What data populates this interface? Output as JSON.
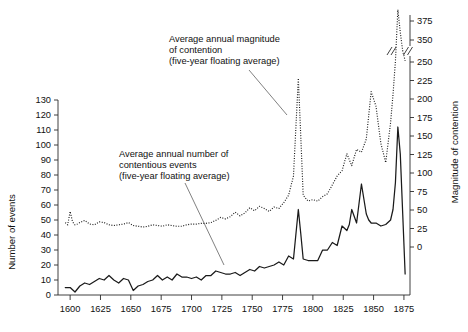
{
  "chart_data": {
    "type": "line",
    "title": "",
    "subtitle": "",
    "xlabel": "",
    "ylabel": "Number of events",
    "y2label": "Magnitude of contention",
    "xlim": [
      1590,
      1880
    ],
    "ylim": [
      0,
      130
    ],
    "y2lim": [
      0,
      375
    ],
    "grid": false,
    "legend_position": "annotations-with-leader-lines",
    "y_ticks": [
      0,
      10,
      20,
      30,
      40,
      50,
      60,
      70,
      80,
      90,
      100,
      110,
      120,
      130
    ],
    "y_tick_labels": [
      "0",
      "10",
      "20",
      "30",
      "40",
      "50",
      "60",
      "70",
      "80",
      "90",
      "100",
      "110",
      "120",
      "130"
    ],
    "y2_ticks": [
      0,
      25,
      50,
      75,
      100,
      125,
      150,
      175,
      200,
      225,
      250,
      350,
      375
    ],
    "y2_tick_labels": [
      "0",
      "25",
      "50",
      "75",
      "100",
      "125",
      "150",
      "175",
      "200",
      "225",
      "250",
      "350",
      "375"
    ],
    "y2_axis_break_between": [
      250,
      350
    ],
    "x_ticks": [
      1600,
      1625,
      1650,
      1675,
      1700,
      1725,
      1750,
      1775,
      1800,
      1825,
      1850,
      1875
    ],
    "x_tick_labels": [
      "1600",
      "1625",
      "1650",
      "1675",
      "1700",
      "1725",
      "1750",
      "1775",
      "1800",
      "1825",
      "1850",
      "1875"
    ],
    "annotations": [
      {
        "id": "magnitude-annotation",
        "lines": [
          "Average annual magnitude",
          "of contention",
          "(five-year floating average)"
        ],
        "points_to_series": "magnitude-of-contention"
      },
      {
        "id": "events-annotation",
        "lines": [
          "Average annual number of",
          "contentious events",
          "(five-year floating average)"
        ],
        "points_to_series": "number-of-contentious-events"
      }
    ],
    "series": [
      {
        "name": "Average annual number of contentious events (five-year floating average)",
        "id": "number-of-contentious-events",
        "axis": "left",
        "style": "solid",
        "color": "#1a1a1a",
        "x": [
          1596,
          1600,
          1604,
          1608,
          1612,
          1616,
          1620,
          1624,
          1628,
          1632,
          1636,
          1640,
          1644,
          1648,
          1652,
          1656,
          1660,
          1664,
          1668,
          1672,
          1676,
          1680,
          1684,
          1688,
          1692,
          1696,
          1700,
          1704,
          1708,
          1712,
          1716,
          1720,
          1724,
          1728,
          1732,
          1736,
          1740,
          1744,
          1748,
          1752,
          1756,
          1760,
          1764,
          1768,
          1772,
          1776,
          1780,
          1784,
          1788,
          1790,
          1792,
          1796,
          1800,
          1804,
          1808,
          1812,
          1816,
          1820,
          1824,
          1828,
          1830,
          1832,
          1836,
          1840,
          1844,
          1846,
          1848,
          1852,
          1856,
          1860,
          1864,
          1866,
          1868,
          1870,
          1872,
          1874,
          1876
        ],
        "values": [
          5,
          5,
          2,
          6,
          8,
          7,
          9,
          11,
          10,
          13,
          10,
          8,
          11,
          10,
          3,
          6,
          7,
          9,
          10,
          13,
          10,
          12,
          10,
          14,
          12,
          12,
          11,
          12,
          10,
          13,
          13,
          16,
          15,
          14,
          14,
          15,
          13,
          15,
          17,
          16,
          19,
          18,
          19,
          20,
          22,
          20,
          26,
          24,
          57,
          41,
          24,
          23,
          23,
          23,
          30,
          30,
          35,
          33,
          46,
          43,
          47,
          57,
          48,
          74,
          54,
          50,
          48,
          48,
          46,
          47,
          50,
          57,
          75,
          112,
          94,
          54,
          14
        ]
      },
      {
        "name": "Average annual magnitude of contention (five-year floating average)",
        "id": "magnitude-of-contention",
        "axis": "right",
        "style": "dotted",
        "color": "#1a1a1a",
        "x": [
          1596,
          1598,
          1600,
          1602,
          1604,
          1606,
          1608,
          1612,
          1616,
          1620,
          1624,
          1628,
          1632,
          1636,
          1640,
          1644,
          1648,
          1652,
          1656,
          1660,
          1664,
          1668,
          1672,
          1676,
          1680,
          1684,
          1688,
          1692,
          1696,
          1700,
          1704,
          1708,
          1712,
          1716,
          1720,
          1724,
          1728,
          1732,
          1736,
          1740,
          1744,
          1748,
          1752,
          1756,
          1760,
          1764,
          1768,
          1772,
          1776,
          1780,
          1784,
          1788,
          1790,
          1792,
          1796,
          1800,
          1804,
          1808,
          1812,
          1816,
          1820,
          1824,
          1828,
          1832,
          1836,
          1840,
          1844,
          1848,
          1852,
          1856,
          1860,
          1864,
          1866,
          1868,
          1870,
          1872,
          1874,
          1876
        ],
        "values": [
          33,
          30,
          48,
          34,
          30,
          31,
          33,
          36,
          31,
          30,
          34,
          33,
          30,
          29,
          30,
          31,
          33,
          29,
          28,
          27,
          28,
          30,
          29,
          28,
          30,
          29,
          28,
          28,
          30,
          31,
          31,
          32,
          32,
          33,
          36,
          40,
          38,
          41,
          47,
          42,
          46,
          53,
          49,
          55,
          52,
          48,
          54,
          52,
          60,
          70,
          96,
          228,
          150,
          70,
          62,
          64,
          62,
          68,
          72,
          84,
          96,
          103,
          126,
          110,
          132,
          128,
          146,
          210,
          190,
          140,
          114,
          168,
          206,
          254,
          390,
          360,
          300,
          255
        ]
      }
    ]
  },
  "axes": {
    "left_title": "Number of events",
    "right_title": "Magnitude of contention"
  },
  "annotation_1": {
    "line_1": "Average annual magnitude",
    "line_2": "of contention",
    "line_3": "(five-year floating average)"
  },
  "annotation_2": {
    "line_1": "Average annual number of",
    "line_2": "contentious events",
    "line_3": "(five-year floating average)"
  },
  "x_labels": {
    "t0": "1600",
    "t1": "1625",
    "t2": "1650",
    "t3": "1675",
    "t4": "1700",
    "t5": "1725",
    "t6": "1750",
    "t7": "1775",
    "t8": "1800",
    "t9": "1825",
    "t10": "1850",
    "t11": "1875"
  },
  "y_labels": {
    "v0": "0",
    "v10": "10",
    "v20": "20",
    "v30": "30",
    "v40": "40",
    "v50": "50",
    "v60": "60",
    "v70": "70",
    "v80": "80",
    "v90": "90",
    "v100": "100",
    "v110": "110",
    "v120": "120",
    "v130": "130"
  },
  "y2_labels": {
    "w0": "0",
    "w25": "25",
    "w50": "50",
    "w75": "75",
    "w100": "100",
    "w125": "125",
    "w150": "150",
    "w175": "175",
    "w200": "200",
    "w225": "225",
    "w250": "250",
    "w350": "350",
    "w375": "375"
  }
}
